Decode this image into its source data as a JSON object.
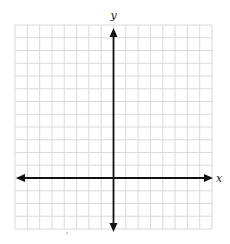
{
  "diagram": {
    "type": "coordinate-plane",
    "grid": {
      "columns": 16,
      "rows": 16,
      "left": 15,
      "top": 25,
      "right": 212,
      "bottom": 229,
      "line_color": "#d6d6d6",
      "background": "#ffffff"
    },
    "origin": {
      "column": 8,
      "row": 12
    },
    "axes": {
      "color": "#111111",
      "x_label": "x",
      "y_label": "y",
      "x_arrows": [
        "left",
        "right"
      ],
      "y_arrows": [
        "up",
        "down"
      ]
    }
  }
}
